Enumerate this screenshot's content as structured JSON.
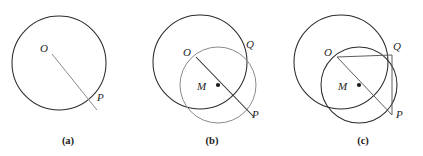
{
  "figure": {
    "background_color": "#ffffff",
    "width": 423,
    "height": 156,
    "stroke_color_primary": "#2b2b2b",
    "stroke_color_secondary": "#5d5d5d",
    "stroke_color_light": "#8a8a8a",
    "marker_color": "#1a1a1a"
  },
  "panels": [
    {
      "id": "a",
      "caption": "(a)",
      "caption_x": 68,
      "caption_y": 144,
      "description": "Circle with center O and a segment drawn from O out to external point P",
      "circles": [
        {
          "name": "circle-O",
          "cx": 59,
          "cy": 63,
          "r": 47,
          "tone": "dark"
        }
      ],
      "segments": [
        {
          "name": "segment-OP",
          "x1": 52,
          "y1": 54,
          "x2": 97,
          "y2": 110,
          "tone": "light"
        }
      ],
      "markers": [],
      "labels": [
        {
          "name": "label-O",
          "text": "O",
          "x": 40,
          "y": 52
        },
        {
          "name": "label-P",
          "text": "P",
          "x": 97,
          "y": 101
        }
      ]
    },
    {
      "id": "b",
      "caption": "(b)",
      "caption_x": 212,
      "caption_y": 144,
      "description": "Circle O plus circle centered at M, the midpoint of OP; the two circles meet at Q",
      "circles": [
        {
          "name": "circle-O",
          "cx": 200,
          "cy": 62,
          "r": 47,
          "tone": "dark"
        },
        {
          "name": "circle-M",
          "cx": 218,
          "cy": 85,
          "r": 38,
          "tone": "light"
        }
      ],
      "segments": [
        {
          "name": "segment-OP",
          "x1": 196,
          "y1": 57,
          "x2": 254,
          "y2": 117,
          "tone": "dark"
        }
      ],
      "markers": [
        {
          "name": "point-M-dot",
          "cx": 218,
          "cy": 85,
          "r": 2.1
        }
      ],
      "labels": [
        {
          "name": "label-O",
          "text": "O",
          "x": 183,
          "y": 56
        },
        {
          "name": "label-Q",
          "text": "Q",
          "x": 246,
          "y": 48
        },
        {
          "name": "label-M",
          "text": "M",
          "x": 197,
          "y": 90
        },
        {
          "name": "label-P",
          "text": "P",
          "x": 252,
          "y": 118
        }
      ]
    },
    {
      "id": "c",
      "caption": "(c)",
      "caption_x": 363,
      "caption_y": 144,
      "description": "Triangle OQP inscribed in circle M, with OP as diameter, giving a right angle at Q",
      "circles": [
        {
          "name": "circle-O",
          "cx": 341,
          "cy": 62,
          "r": 47,
          "tone": "dark"
        },
        {
          "name": "circle-M",
          "cx": 359,
          "cy": 85,
          "r": 38,
          "tone": "dark"
        }
      ],
      "segments": [
        {
          "name": "segment-OP",
          "x1": 337,
          "y1": 57,
          "x2": 392,
          "y2": 115,
          "tone": "mid"
        },
        {
          "name": "segment-OQ",
          "x1": 337,
          "y1": 57,
          "x2": 392,
          "y2": 55,
          "tone": "mid"
        },
        {
          "name": "segment-QP",
          "x1": 392,
          "y1": 55,
          "x2": 392,
          "y2": 115,
          "tone": "mid"
        }
      ],
      "markers": [
        {
          "name": "point-M-dot",
          "cx": 359,
          "cy": 85,
          "r": 2.1
        }
      ],
      "labels": [
        {
          "name": "label-O",
          "text": "O",
          "x": 324,
          "y": 56
        },
        {
          "name": "label-Q",
          "text": "Q",
          "x": 393,
          "y": 50
        },
        {
          "name": "label-M",
          "text": "M",
          "x": 338,
          "y": 90
        },
        {
          "name": "label-P",
          "text": "P",
          "x": 396,
          "y": 118
        }
      ]
    }
  ]
}
